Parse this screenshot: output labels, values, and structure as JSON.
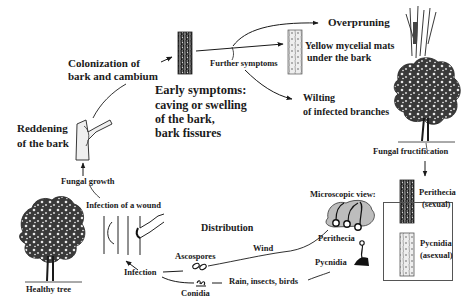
{
  "diagram": {
    "stages": {
      "healthy_tree": "Healthy tree",
      "infection_of_wound": "Infection of a wound",
      "fungal_growth": "Fungal growth",
      "reddening_line1": "Reddening",
      "reddening_line2": "of the bark",
      "colonization_line1": "Colonization of",
      "colonization_line2": "bark and cambium",
      "early_symptoms_title": "Early symptoms:",
      "early_symptoms_line1": "caving or swelling",
      "early_symptoms_line2": "of the bark,",
      "early_symptoms_line3": "bark fissures",
      "further_symptoms": "Further symptoms",
      "overpruning": "Overpruning",
      "yellow_mats_line1": "Yellow mycelial mats",
      "yellow_mats_line2": "under the bark",
      "wilting_line1": "Wilting",
      "wilting_line2": "of infected branches",
      "fungal_fructification": "Fungal fructification",
      "perithecia_line1": "Perithecia",
      "perithecia_line2": "(sexual)",
      "pycnidia_line1": "Pycnidia",
      "pycnidia_line2": "(asexual)",
      "microscopic_view": "Microscopic view:",
      "micro_perithecia": "Perithecia",
      "micro_pycnidia": "Pycnidia",
      "distribution": "Distribution",
      "wind": "Wind",
      "rain_insects_birds": "Rain, insects, birds",
      "ascospores": "Ascospores",
      "conidia": "Conidia",
      "infection": "Infection"
    },
    "colors": {
      "ink": "#1a1a1a",
      "background": "#ffffff"
    }
  }
}
